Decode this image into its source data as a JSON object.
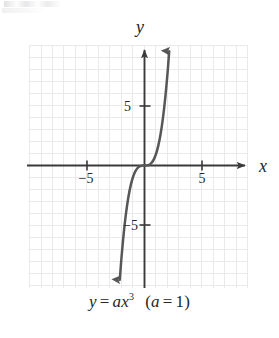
{
  "figure": {
    "caption": {
      "y_var": "y",
      "equals": "=",
      "a_var": "a",
      "x_var": "x",
      "exponent": "3",
      "open_paren": "(",
      "cond_a": "a",
      "cond_equals": "=",
      "cond_value": "1",
      "close_paren": ")",
      "full_text": "y = ax³  (a = 1)"
    },
    "axis_labels": {
      "x": "x",
      "y": "y"
    },
    "tick_labels": {
      "x_neg5": "−5",
      "x_pos5": "5",
      "y_pos5": "5",
      "y_neg5": "−5"
    },
    "colors": {
      "grid": "#e9e9ec",
      "axis": "#3a3a3a",
      "curve": "#575757",
      "text": "#262626",
      "background": "#ffffff"
    }
  },
  "chart_data": {
    "type": "line",
    "title": "",
    "subtitle": "",
    "caption": "y = ax³  (a = 1)",
    "equation": "y = a*x^3",
    "parameters": {
      "a": 1
    },
    "xlabel": "x",
    "ylabel": "y",
    "xlim": [
      -10,
      9
    ],
    "ylim": [
      -10,
      10
    ],
    "xticks": [
      -5,
      5
    ],
    "yticks": [
      -5,
      5
    ],
    "xtick_labels": [
      "−5",
      "5"
    ],
    "ytick_labels": [
      "−5",
      "5"
    ],
    "grid": true,
    "grid_step": 1,
    "legend": "none",
    "axis_arrows": {
      "x_positive": true,
      "y_positive": true
    },
    "series": [
      {
        "name": "y = x^3",
        "curve_arrows": {
          "start": true,
          "end": true
        },
        "x": [
          -2.15,
          -2.0,
          -1.8,
          -1.6,
          -1.4,
          -1.2,
          -1.0,
          -0.8,
          -0.6,
          -0.4,
          -0.2,
          0,
          0.2,
          0.4,
          0.6,
          0.8,
          1.0,
          1.2,
          1.4,
          1.6,
          1.8,
          2.0,
          2.15
        ],
        "y": [
          -9.94,
          -8.0,
          -5.83,
          -4.1,
          -2.74,
          -1.73,
          -1.0,
          -0.51,
          -0.22,
          -0.06,
          -0.01,
          0,
          0.01,
          0.06,
          0.22,
          0.51,
          1.0,
          1.73,
          2.74,
          4.1,
          5.83,
          8.0,
          9.94
        ]
      }
    ]
  }
}
